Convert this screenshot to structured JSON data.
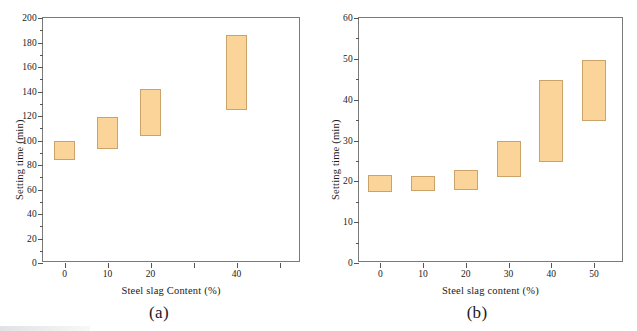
{
  "figure": {
    "background": "#ffffff",
    "bar_fill": "#fbd49a",
    "bar_stroke": "#c9a36a",
    "axis_color": "#7a7a7a"
  },
  "panels": [
    {
      "caption": "(a)",
      "xlabel": "Steel slag Content (%)",
      "ylabel": "Setting time (min)",
      "ylim": [
        0,
        200
      ],
      "yticks": [
        0,
        20,
        40,
        60,
        80,
        100,
        120,
        140,
        160,
        180,
        200
      ],
      "ytick_labels": [
        "0",
        "20",
        "40",
        "60",
        "80",
        "100",
        "120",
        "140",
        "160",
        "180",
        "200"
      ],
      "xlim": [
        -5,
        55
      ],
      "xticks": [
        0,
        10,
        20,
        30,
        40,
        50
      ],
      "xtick_labels": [
        "0",
        "10",
        "20",
        "",
        "40",
        ""
      ],
      "categories": [
        "0",
        "10",
        "20",
        "40"
      ]
    },
    {
      "caption": "(b)",
      "xlabel": "Steel slag content (%)",
      "ylabel": "Setting time (min)",
      "ylim": [
        0,
        60
      ],
      "yticks": [
        0,
        10,
        20,
        30,
        40,
        50,
        60
      ],
      "ytick_labels": [
        "0",
        "10",
        "20",
        "30",
        "40",
        "50",
        "60"
      ],
      "xlim": [
        -5,
        57
      ],
      "xticks": [
        0,
        10,
        20,
        30,
        40,
        50
      ],
      "xtick_labels": [
        "0",
        "10",
        "20",
        "30",
        "40",
        "50"
      ],
      "categories": [
        "0",
        "10",
        "20",
        "30",
        "40",
        "50"
      ]
    }
  ],
  "chart_data": [
    {
      "type": "bar",
      "title": "(a)",
      "xlabel": "Steel slag Content (%)",
      "ylabel": "Setting time (min)",
      "ylim": [
        0,
        200
      ],
      "xlim": [
        -5,
        55
      ],
      "grid": false,
      "legend": "none",
      "categories": [
        "0",
        "10",
        "20",
        "40"
      ],
      "x": [
        0,
        10,
        20,
        40
      ],
      "series": [
        {
          "name": "Setting time range (initial to final)",
          "type": "range-bar",
          "low": [
            84,
            93,
            104,
            125
          ],
          "high": [
            100,
            119,
            142,
            186
          ]
        }
      ]
    },
    {
      "type": "bar",
      "title": "(b)",
      "xlabel": "Steel slag content (%)",
      "ylabel": "Setting time (min)",
      "ylim": [
        0,
        60
      ],
      "xlim": [
        -5,
        57
      ],
      "grid": false,
      "legend": "none",
      "categories": [
        "0",
        "10",
        "20",
        "30",
        "40",
        "50"
      ],
      "x": [
        0,
        10,
        20,
        30,
        40,
        50
      ],
      "series": [
        {
          "name": "Setting time range (initial to final)",
          "type": "range-bar",
          "low": [
            17.4,
            17.6,
            17.8,
            21.0,
            24.7,
            34.8
          ],
          "high": [
            21.5,
            21.2,
            22.7,
            30.0,
            44.8,
            49.7
          ]
        }
      ]
    }
  ]
}
